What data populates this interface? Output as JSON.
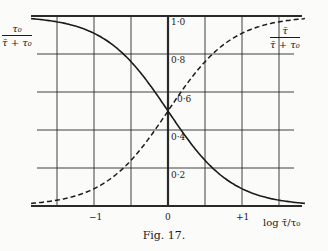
{
  "chart_data": {
    "type": "line",
    "title": "",
    "caption": "Fig. 17.",
    "xlabel": "log τ̄/τ₀",
    "ylabel": "",
    "xlim": [
      -1.85,
      1.85
    ],
    "ylim": [
      0,
      1.0
    ],
    "grid": true,
    "x_ticks": [
      -1,
      0,
      1
    ],
    "x_tick_labels": [
      "−1",
      "0",
      "+1"
    ],
    "y_ticks": [
      0.2,
      0.4,
      0.6,
      0.8,
      1.0
    ],
    "y_tick_labels": [
      "0·2",
      "0·4",
      "0·6",
      "0·8",
      "1·0"
    ],
    "x": [
      -1.75,
      -1.5,
      -1.25,
      -1.0,
      -0.75,
      -0.5,
      -0.25,
      0.0,
      0.25,
      0.5,
      0.75,
      1.0,
      1.25,
      1.5,
      1.75
    ],
    "series": [
      {
        "name": "τ₀ / (τ̄ + τ₀)",
        "style": "solid",
        "values": [
          0.98,
          0.97,
          0.95,
          0.91,
          0.85,
          0.76,
          0.64,
          0.5,
          0.36,
          0.24,
          0.15,
          0.09,
          0.05,
          0.03,
          0.02
        ]
      },
      {
        "name": "τ̄ / (τ̄ + τ₀)",
        "style": "dashed",
        "values": [
          0.02,
          0.03,
          0.05,
          0.09,
          0.15,
          0.24,
          0.36,
          0.5,
          0.64,
          0.76,
          0.85,
          0.91,
          0.95,
          0.97,
          0.98
        ]
      }
    ],
    "annotations": [
      {
        "text": "τ₀ / (τ̄ + τ₀)",
        "position": "upper-left"
      },
      {
        "text": "τ̄ / (τ̄ + τ₀)",
        "position": "upper-right"
      }
    ]
  },
  "labels": {
    "left_curve": {
      "num": "τ₀",
      "den": "τ̄ + τ₀"
    },
    "right_curve": {
      "num": "τ̄",
      "den": "τ̄ + τ₀"
    },
    "y_ticks": [
      "1·0",
      "0·8",
      "0·6",
      "0·4",
      "0·2"
    ],
    "x_ticks": [
      "−1",
      "0",
      "+1"
    ],
    "x_axis_title": "log τ̄/τ₀",
    "caption": "Fig. 17."
  }
}
